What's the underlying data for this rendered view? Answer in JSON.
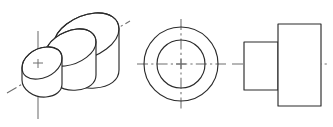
{
  "drawing": {
    "title": "Stepped Cylindrical Hub — Orthographic and Pictorial Views",
    "sheet_background": "#ffffff",
    "object_line_color": "#2b2b2b",
    "center_line_color": "#6e6e6e",
    "line_weight_px": 1.15,
    "views": [
      {
        "id": "isometric-view",
        "label": "Isometric pictorial view",
        "position": "left",
        "description": "Three-diameter stepped cylinder drawn in isometric projection with elliptical faces, an inclined axis centre line and a vertical centre line through the front boss.",
        "features": [
          "large rear flange ellipse",
          "intermediate step ellipse",
          "front boss ellipse",
          "inclined axis centre line",
          "vertical centre line"
        ]
      },
      {
        "id": "front-view",
        "label": "Front view",
        "position": "middle",
        "description": "Two concentric circles representing the outer flange diameter and the boss diameter, with horizontal and vertical centre lines crossing at the axis.",
        "circles": [
          {
            "name": "outer-flange-circle",
            "radius_px": 37
          },
          {
            "name": "inner-boss-circle",
            "radius_px": 24
          }
        ],
        "center_marks": [
          "horizontal-center-line",
          "vertical-center-line"
        ]
      },
      {
        "id": "side-view",
        "label": "Right side view",
        "position": "right",
        "description": "Stepped rectangular outline: a short small-diameter boss on the left joined to a tall large-diameter flange on the right, bisected by a dash-dot axis centre line.",
        "profiles": [
          {
            "name": "boss-rectangle",
            "width_px": 34,
            "height_px": 48
          },
          {
            "name": "flange-rectangle",
            "width_px": 43,
            "height_px": 82
          }
        ],
        "center_marks": [
          "horizontal-axis-center-line"
        ]
      }
    ]
  }
}
